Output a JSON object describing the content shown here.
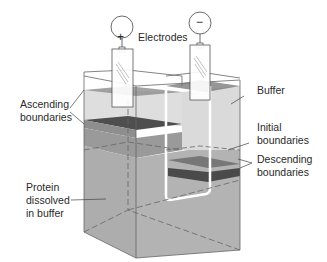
{
  "labels": {
    "electrodes": "Electrodes",
    "buffer": "Buffer",
    "ascending_line1": "Ascending",
    "ascending_line2": "boundaries",
    "initial_line1": "Initial",
    "initial_line2": "boundaries",
    "descending_line1": "Descending",
    "descending_line2": "boundaries",
    "protein_line1": "Protein",
    "protein_line2": "dissolved",
    "protein_line3": "in buffer"
  },
  "electrodes": {
    "anode_symbol": "+",
    "cathode_symbol": "−"
  },
  "colors": {
    "buffer": "#dcdcdc",
    "protein": "#a9a9a9",
    "boundary_dark": "#5c5c5c",
    "boundary_mid": "#7a7a7a",
    "outline": "#555555"
  }
}
